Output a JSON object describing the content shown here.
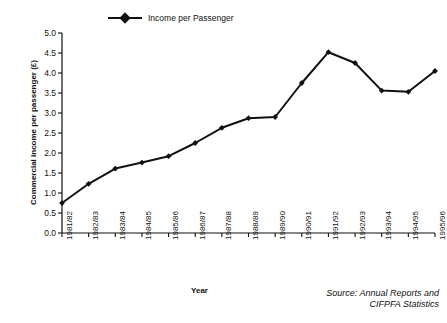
{
  "chart_data": {
    "type": "line",
    "title": "",
    "xlabel": "Year",
    "ylabel": "Commercial income per passenger (£)",
    "ylim": [
      0.0,
      5.0
    ],
    "ytick_labels": [
      "0.0",
      "0.5",
      "1.0",
      "1.5",
      "2.0",
      "2.5",
      "3.0",
      "3.5",
      "4.0",
      "4.5",
      "5.0"
    ],
    "ytick_values": [
      0.0,
      0.5,
      1.0,
      1.5,
      2.0,
      2.5,
      3.0,
      3.5,
      4.0,
      4.5,
      5.0
    ],
    "grid": false,
    "legend_position": "top-center",
    "categories": [
      "1981/82",
      "1982/83",
      "1983/84",
      "1984/85",
      "1985/86",
      "1986/87",
      "1987/88",
      "1988/89",
      "1989/90",
      "1990/91",
      "1991/92",
      "1992/93",
      "1993/94",
      "1994/95",
      "1995/96"
    ],
    "series": [
      {
        "name": "Income per Passenger",
        "marker": "diamond",
        "color": "#111111",
        "values": [
          0.75,
          1.23,
          1.61,
          1.76,
          1.92,
          2.25,
          2.63,
          2.87,
          2.9,
          3.75,
          4.52,
          4.25,
          3.56,
          3.53,
          4.05
        ]
      }
    ],
    "annotations": [
      "Source: Annual Reports and",
      "CIFPFA Statistics"
    ]
  },
  "legend": {
    "entry_label": "Income per Passenger",
    "marker_icon": "diamond-marker-icon",
    "line_icon": "legend-line-icon"
  },
  "axes": {
    "y_title": "Commercial income per passenger (£)",
    "x_title": "Year"
  },
  "source_note": {
    "line1": "Source: Annual Reports and",
    "line2": "CIFPFA Statistics"
  }
}
